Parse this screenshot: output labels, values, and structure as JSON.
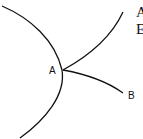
{
  "diagram": {
    "labels": {
      "point_a": "A",
      "point_b": "B"
    },
    "cropped_text": [
      "A",
      "E"
    ],
    "stroke_color": "#111111",
    "background": "#ffffff"
  }
}
